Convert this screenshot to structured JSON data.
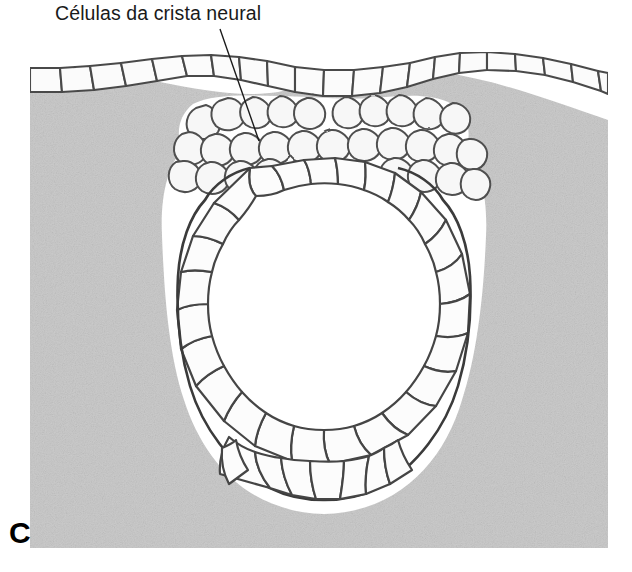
{
  "figure": {
    "panel_letter": "C",
    "caption_label": "Células da crista neural",
    "language": "pt-BR",
    "colors": {
      "background": "#ffffff",
      "mesenchyme_gray": "#cbcbcb",
      "cell_fill": "#fafafa",
      "cell_outline": "#4a4a4a",
      "cell_outline_dark": "#2e2e2e",
      "text": "#1a1a1a",
      "leader_line": "#1a1a1a"
    },
    "canvas": {
      "width": 632,
      "height": 572
    },
    "plate": {
      "x": 30,
      "y": 52,
      "width": 578,
      "height": 496
    },
    "leader_line": {
      "x1": 220,
      "y1": 29,
      "x2": 259,
      "y2": 141
    },
    "structures": [
      {
        "name": "surface-ectoderm",
        "label": "epiderme / ectoderma superficial"
      },
      {
        "name": "neural-crest-cells",
        "label": "Células da crista neural"
      },
      {
        "name": "neural-tube",
        "label": "tubo neural"
      },
      {
        "name": "neural-tube-lumen",
        "label": "lúmen do tubo neural"
      },
      {
        "name": "mesenchyme",
        "label": "mesênquima"
      }
    ]
  }
}
